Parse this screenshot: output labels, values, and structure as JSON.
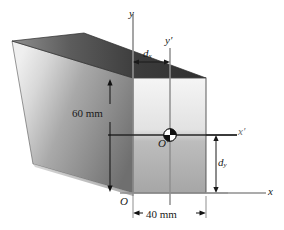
{
  "figure": {
    "header_fragment": "— — — — — — — —",
    "axes": {
      "y_label": "y",
      "y_prime_label": "y",
      "y_prime_mark": "′",
      "x_label": "x",
      "x_prime_label": "x",
      "x_prime_mark": "′",
      "origin_label": "O",
      "centroid_label": "O",
      "centroid_mark": "′"
    },
    "dimensions": [
      {
        "name": "height",
        "label": "60 mm",
        "value": 60,
        "unit": "mm"
      },
      {
        "name": "width",
        "label": "40 mm",
        "value": 40,
        "unit": "mm"
      }
    ],
    "offsets": [
      {
        "name": "dx",
        "base": "d",
        "sub": "x"
      },
      {
        "name": "dy",
        "base": "d",
        "sub": "y"
      }
    ],
    "colors": {
      "front_face_light": "#f2f2f2",
      "front_face_dark": "#9f9f9f",
      "top_face_dark": "#3a3a3a",
      "top_face_light": "#8a8a8a",
      "side_face_light": "#e8e8e8",
      "side_face_dark": "#777777",
      "line": "#1a1a1a",
      "axis_gray": "#9a9a9a",
      "text": "#1a1a1a"
    }
  }
}
